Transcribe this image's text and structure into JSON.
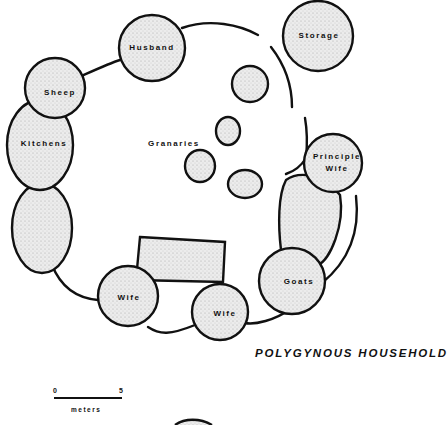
{
  "diagram": {
    "title": "POLYGYNOUS HOUSEHOLD",
    "structures": [
      {
        "id": "husband",
        "label": "Husband"
      },
      {
        "id": "storage",
        "label": "Storage"
      },
      {
        "id": "sheep",
        "label": "Sheep"
      },
      {
        "id": "kitchens",
        "label": "Kitchens"
      },
      {
        "id": "granaries",
        "label": "Granaries"
      },
      {
        "id": "principle-wife",
        "label_line1": "Principle",
        "label_line2": "Wife"
      },
      {
        "id": "goats",
        "label": "Goats"
      },
      {
        "id": "wife-left",
        "label": "Wife"
      },
      {
        "id": "wife-right",
        "label": "Wife"
      }
    ],
    "scale_bar": {
      "min": "0",
      "max": "5",
      "unit": "meters"
    },
    "colors": {
      "ink": "#111111",
      "fill": "#e6e6e6",
      "background": "#ffffff"
    }
  }
}
